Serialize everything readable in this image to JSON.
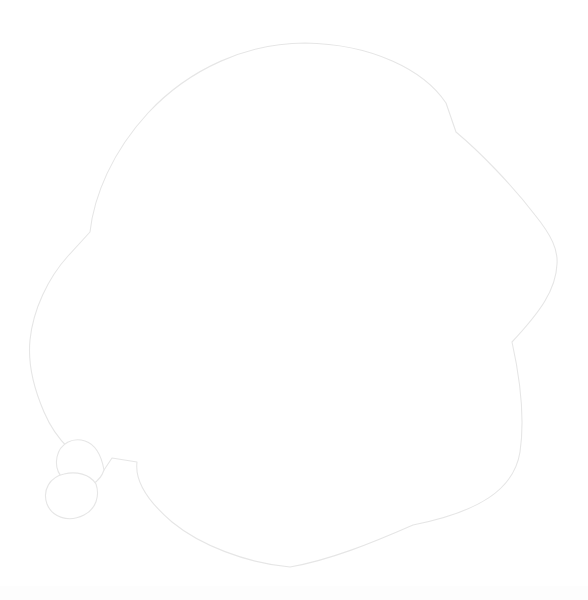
{
  "canvas": {
    "width": 588,
    "height": 600,
    "background_color": "#ffffff",
    "title": "Outline Drawing"
  },
  "figure": {
    "name": "blob-outline",
    "stroke_color": "#e6e6e6",
    "fill_color": "#ffffff",
    "stroke_width": 1.1,
    "bounding_box": {
      "x": 29,
      "y": 42,
      "width": 530,
      "height": 527
    },
    "extrema": {
      "top_apex": [
        305,
        43
      ],
      "rightmost": [
        558,
        255
      ],
      "bottom_most": [
        290,
        567
      ],
      "leftmost": [
        30,
        340
      ]
    },
    "vertices": {
      "top_right_notch": [
        456,
        132
      ],
      "right_corner": [
        512,
        342
      ],
      "lower_right_corner": [
        413,
        525
      ],
      "left_notch": [
        90,
        232
      ],
      "stem_peak_left": [
        112,
        458
      ],
      "stem_peak_right": [
        137,
        462
      ]
    },
    "main_path": "M 305 43 C 372 44 424 70 446 103 L 456 132 C 480 152 512 185 535 215 C 552 236 558 250 557 264 C 556 290 540 312 512 342 C 520 378 525 418 520 452 C 514 490 478 512 413 525 C 372 543 330 560 290 567 C 246 563 200 545 172 522 C 144 498 135 478 137 462 L 112 458 L 104 470 C 78 462 56 440 44 412 C 31 382 28 360 30 340 C 33 310 48 278 68 256 L 90 232 C 94 196 112 152 148 113 C 190 68 248 43 305 43 Z",
    "lobes": [
      {
        "name": "upper-lobe",
        "path": "M 104 470 C 100 482 88 489 78 487 C 63 484 54 471 57 457 C 60 443 73 437 85 441 C 94 444 101 453 104 470 Z",
        "center": [
          78,
          465
        ],
        "radius": 22
      },
      {
        "name": "lower-lobe",
        "path": "M 96 484 C 100 496 96 509 84 515 C 68 523 52 517 47 504 C 42 490 50 477 64 474 C 76 471 90 474 96 484 Z",
        "center": [
          74,
          497
        ],
        "radius": 21
      }
    ]
  },
  "artifacts": {
    "bottom_band": {
      "name": "bottom-compression-band",
      "y": 586,
      "height": 14,
      "color": "#fdfdfd"
    }
  }
}
